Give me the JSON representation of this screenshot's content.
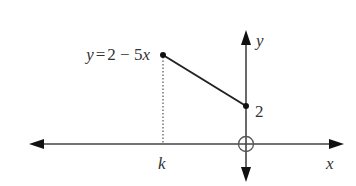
{
  "diagram": {
    "equation_label": "y = 2 − 5x",
    "equation_parts": {
      "y": "y",
      "eq": "=",
      "rest": "2 − 5",
      "x": "x"
    },
    "y_axis_label": "y",
    "x_axis_label": "x",
    "y_intercept_label": "2",
    "k_label": "k",
    "origin_symbol": "origin-circle",
    "colors": {
      "line": "#222222",
      "axis": "#444444",
      "text": "#333333",
      "dotted": "#555555"
    }
  }
}
